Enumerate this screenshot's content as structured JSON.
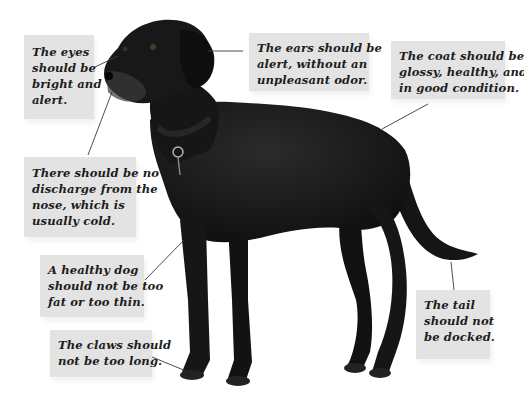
{
  "figure": {
    "colors": {
      "background": "#ffffff",
      "callout_fill": "#e3e3e3",
      "callout_text": "#1d1d1d",
      "leader_line": "#3a3a3a",
      "dog_body": "#141414"
    }
  },
  "callouts": {
    "eyes": {
      "lines": [
        "The eyes",
        "should be",
        "bright and",
        "alert."
      ]
    },
    "ears": {
      "lines": [
        "The ears should be",
        "alert, without an",
        "unpleasant odor."
      ]
    },
    "coat": {
      "lines": [
        "The coat should be",
        "glossy, healthy, and",
        "in good condition."
      ]
    },
    "nose": {
      "lines": [
        "There should be no",
        "discharge from the",
        "nose, which is",
        "usually cold."
      ]
    },
    "healthy": {
      "lines": [
        "A healthy dog",
        "should not be too",
        "fat or too thin."
      ]
    },
    "claws": {
      "lines": [
        "The claws should",
        "not be too long."
      ]
    },
    "tail": {
      "lines": [
        "The tail",
        "should not",
        "be docked."
      ]
    }
  }
}
